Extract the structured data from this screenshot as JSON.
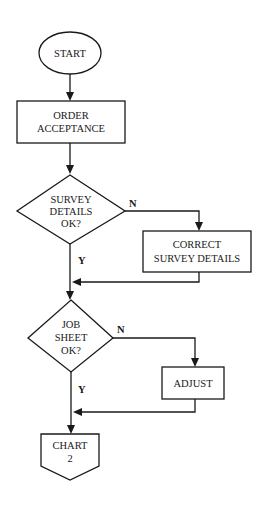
{
  "diagram": {
    "type": "flowchart",
    "nodes": [
      {
        "id": "start",
        "shape": "ellipse",
        "lines": [
          "START"
        ]
      },
      {
        "id": "order_acceptance",
        "shape": "process",
        "lines": [
          "ORDER",
          "ACCEPTANCE"
        ]
      },
      {
        "id": "survey_ok",
        "shape": "decision",
        "lines": [
          "SURVEY",
          "DETAILS",
          "OK?"
        ]
      },
      {
        "id": "correct_survey",
        "shape": "process",
        "lines": [
          "CORRECT",
          "SURVEY DETAILS"
        ]
      },
      {
        "id": "job_sheet_ok",
        "shape": "decision",
        "lines": [
          "JOB",
          "SHEET",
          "OK?"
        ]
      },
      {
        "id": "adjust",
        "shape": "process",
        "lines": [
          "ADJUST"
        ]
      },
      {
        "id": "chart2",
        "shape": "off-page-connector",
        "lines": [
          "CHART",
          "2"
        ]
      }
    ],
    "edges": [
      {
        "from": "start",
        "to": "order_acceptance",
        "label": ""
      },
      {
        "from": "order_acceptance",
        "to": "survey_ok",
        "label": ""
      },
      {
        "from": "survey_ok",
        "to": "correct_survey",
        "label": "N"
      },
      {
        "from": "survey_ok",
        "to": "job_sheet_ok",
        "label": "Y"
      },
      {
        "from": "correct_survey",
        "to": "job_sheet_ok",
        "label": ""
      },
      {
        "from": "job_sheet_ok",
        "to": "adjust",
        "label": "N"
      },
      {
        "from": "job_sheet_ok",
        "to": "chart2",
        "label": "Y"
      },
      {
        "from": "adjust",
        "to": "chart2",
        "label": ""
      }
    ],
    "labels": {
      "yes": "Y",
      "no": "N"
    }
  }
}
